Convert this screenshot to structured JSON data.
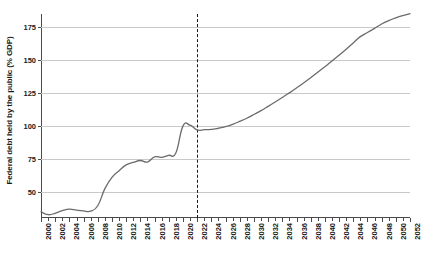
{
  "chart_data": {
    "type": "line",
    "title": "",
    "xlabel": "",
    "ylabel": "Federal debt held by the public (% GDP)",
    "xlim": [
      2000,
      2052
    ],
    "ylim": [
      30,
      185
    ],
    "grid": true,
    "legend": null,
    "yticks": [
      50,
      75,
      100,
      125,
      150,
      175
    ],
    "xticks": [
      2000,
      2002,
      2004,
      2006,
      2008,
      2010,
      2012,
      2014,
      2016,
      2018,
      2020,
      2022,
      2024,
      2026,
      2028,
      2030,
      2032,
      2034,
      2036,
      2038,
      2040,
      2042,
      2044,
      2046,
      2048,
      2050,
      2052
    ],
    "xtick_labels": [
      "2000",
      "2002",
      "2004",
      "2006",
      "2008",
      "2010",
      "2012",
      "2014",
      "2016",
      "2018",
      "2020",
      "2022",
      "2024",
      "2026",
      "2028",
      "2030",
      "2032",
      "2034",
      "2036",
      "2038",
      "2040",
      "2042",
      "2044",
      "2046",
      "2048",
      "2050",
      "2052"
    ],
    "annotations": [
      {
        "type": "vline",
        "x": 2022,
        "style": "dashed",
        "color": "#1a1a1a",
        "label": ""
      }
    ],
    "series": [
      {
        "name": "Federal debt held by the public (% GDP)",
        "color": "#6b6b6b",
        "x": [
          2000,
          2001,
          2002,
          2003,
          2004,
          2005,
          2006,
          2007,
          2008,
          2009,
          2010,
          2011,
          2012,
          2013,
          2014,
          2015,
          2016,
          2017,
          2018,
          2019,
          2020,
          2021,
          2022,
          2023,
          2024,
          2025,
          2026,
          2027,
          2028,
          2029,
          2030,
          2031,
          2032,
          2033,
          2034,
          2035,
          2036,
          2037,
          2038,
          2039,
          2040,
          2041,
          2042,
          2043,
          2044,
          2045,
          2046,
          2047,
          2048,
          2049,
          2050,
          2051,
          2052
        ],
        "values": [
          34.7,
          32.5,
          33.6,
          35.6,
          36.8,
          36.0,
          35.4,
          35.2,
          39.3,
          52.3,
          60.9,
          65.9,
          70.4,
          72.2,
          73.7,
          72.5,
          76.4,
          76.1,
          77.6,
          79.4,
          99.8,
          100.5,
          96.9,
          97.1,
          97.3,
          98.2,
          99.4,
          101.2,
          103.4,
          105.8,
          108.6,
          111.6,
          114.8,
          118.1,
          121.5,
          125.1,
          128.8,
          132.6,
          136.6,
          140.7,
          144.9,
          149.2,
          153.7,
          158.3,
          163.0,
          167.8,
          170.9,
          174.1,
          177.4,
          180.0,
          182.1,
          183.8,
          185.2
        ]
      }
    ]
  },
  "style": {
    "line_color": "#6b6b6b",
    "grid_color": "#c9c9c9",
    "axis_color": "#4a4a4a",
    "text_color": "#1a1a1a",
    "background": "#ffffff"
  }
}
